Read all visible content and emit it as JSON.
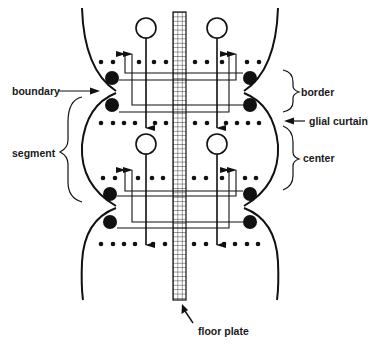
{
  "diagram": {
    "type": "neural segment schematic",
    "colors": {
      "ink": "#111111",
      "background": "#ffffff"
    },
    "labels": {
      "boundary": "boundary",
      "segment": "segment",
      "border": "border",
      "glial_curtain": "glial curtain",
      "center": "center",
      "floor_plate": "floor plate"
    },
    "structures": {
      "floor_plate": {
        "x": 173,
        "y_top": 12,
        "y_bottom": 300,
        "width": 13
      },
      "segments": [
        {
          "name": "segment-1",
          "cell_body_y": 28,
          "upper_dots_y": 62,
          "upper_large_y": 78,
          "cusp_y": 92,
          "lower_large_y": 105,
          "lower_dots_y": 123,
          "arrow_end_y": 137
        },
        {
          "name": "segment-2",
          "cell_body_y": 144,
          "upper_dots_y": 178,
          "upper_large_y": 193,
          "cusp_y": 207,
          "lower_large_y": 222,
          "lower_dots_y": 239,
          "arrow_end_y": 254
        }
      ]
    }
  }
}
